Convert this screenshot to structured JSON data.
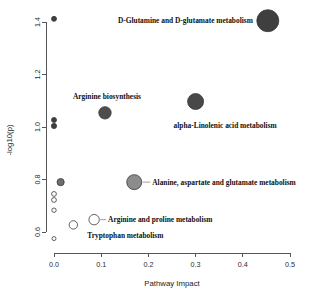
{
  "chart_data": {
    "type": "scatter",
    "title": "",
    "xlabel": "Pathway Impact",
    "ylabel": "-log10(p)",
    "xlim": [
      -0.012,
      0.52
    ],
    "ylim": [
      0.55,
      1.45
    ],
    "xticks": [
      "0.0",
      "0.1",
      "0.2",
      "0.3",
      "0.4",
      "0.5"
    ],
    "xtick_values": [
      0.0,
      0.1,
      0.2,
      0.3,
      0.4,
      0.5
    ],
    "yticks": [
      "0.6",
      "0.8",
      "1.0",
      "1.2",
      "1.4"
    ],
    "ytick_values": [
      0.6,
      0.8,
      1.0,
      1.2,
      1.4
    ],
    "grid": false,
    "legend": "none",
    "colors": {
      "dark_bubble": "#3f3f3f",
      "mid_bubble": "#8c8c8c",
      "light_bubble": "#ffffff",
      "bubble_stroke": "#3a3a3a",
      "axis": "#555555",
      "text": "#111111"
    },
    "points": [
      {
        "label": "D-Glutamine and D-glutamate metabolism",
        "x": 0.453,
        "y": 1.405,
        "size": 11.0,
        "fill": "#3f3f3f",
        "label_side": "left",
        "label_dx": -15,
        "label_dy": 2,
        "leader": false
      },
      {
        "label": "alpha-Linolenic acid metabolism",
        "x": 0.3,
        "y": 1.097,
        "size": 8.0,
        "fill": "#484848",
        "label_side": "below",
        "label_dx": 22,
        "label_dy": 26,
        "leader": false
      },
      {
        "label": "Arginine biosynthesis",
        "x": 0.108,
        "y": 1.054,
        "size": 6.2,
        "fill": "#4d4d4d",
        "label_side": "above",
        "label_dx": 2,
        "label_dy": -14,
        "leader": false
      },
      {
        "label": "Alanine, aspartate and glutamate metabolism",
        "x": 0.17,
        "y": 0.79,
        "size": 7.5,
        "fill": "#8c8c8c",
        "label_side": "right",
        "label_dx": 18,
        "label_dy": 2.6,
        "leader": true
      },
      {
        "label": "Arginine and proline metabolism",
        "x": 0.085,
        "y": 0.647,
        "size": 5.2,
        "fill": "#ffffff",
        "label_side": "right",
        "label_dx": 14,
        "label_dy": 2.6,
        "leader": true
      },
      {
        "label": "Tryptophan metabolism",
        "x": 0.041,
        "y": 0.627,
        "size": 4.2,
        "fill": "#ffffff",
        "label_side": "right-below",
        "label_dx": 14,
        "label_dy": 13,
        "leader": false
      },
      {
        "label": "",
        "x": 0.0,
        "y": 1.412,
        "size": 2.5,
        "fill": "#3f3f3f",
        "label_side": "none",
        "label_dx": 0,
        "label_dy": 0,
        "leader": false
      },
      {
        "label": "",
        "x": 0.0,
        "y": 1.027,
        "size": 2.5,
        "fill": "#3f3f3f",
        "label_side": "none",
        "label_dx": 0,
        "label_dy": 0,
        "leader": false
      },
      {
        "label": "",
        "x": 0.0,
        "y": 1.004,
        "size": 2.6,
        "fill": "#3f3f3f",
        "label_side": "none",
        "label_dx": 0,
        "label_dy": 0,
        "leader": false
      },
      {
        "label": "",
        "x": 0.014,
        "y": 0.79,
        "size": 3.6,
        "fill": "#6e6e6e",
        "label_side": "none",
        "label_dx": 0,
        "label_dy": 0,
        "leader": false
      },
      {
        "label": "",
        "x": 0.0,
        "y": 0.745,
        "size": 2.4,
        "fill": "#ffffff",
        "label_side": "none",
        "label_dx": 0,
        "label_dy": 0,
        "leader": false
      },
      {
        "label": "",
        "x": 0.0,
        "y": 0.722,
        "size": 2.4,
        "fill": "#ffffff",
        "label_side": "none",
        "label_dx": 0,
        "label_dy": 0,
        "leader": false
      },
      {
        "label": "",
        "x": 0.0,
        "y": 0.683,
        "size": 2.2,
        "fill": "#ffffff",
        "label_side": "none",
        "label_dx": 0,
        "label_dy": 0,
        "leader": false
      },
      {
        "label": "",
        "x": 0.0,
        "y": 0.575,
        "size": 2.0,
        "fill": "#ffffff",
        "label_side": "none",
        "label_dx": 0,
        "label_dy": 0,
        "leader": false
      }
    ]
  }
}
